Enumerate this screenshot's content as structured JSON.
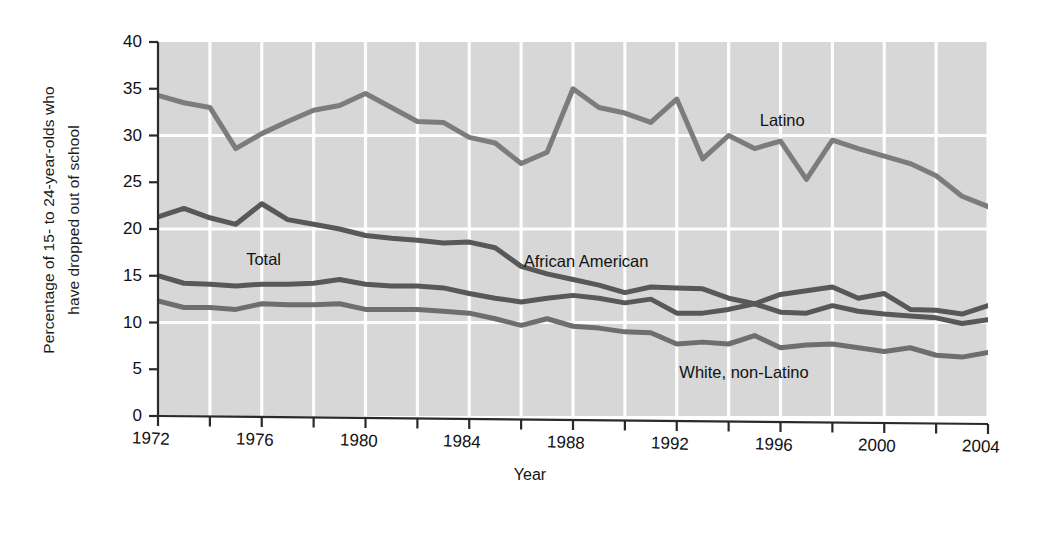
{
  "chart_data": {
    "type": "line",
    "title": "",
    "xlabel": "Year",
    "ylabel": "Percentage of 15- to  24-year-olds who have dropped out of school",
    "ylabel_line1": "Percentage of 15- to  24-year-olds who",
    "ylabel_line2": "have dropped out of school",
    "xlim": [
      1972,
      2004
    ],
    "ylim": [
      0,
      40
    ],
    "grid": "both",
    "legend_position": "inline-annotations",
    "y_ticks": [
      0,
      5,
      10,
      15,
      20,
      25,
      30,
      35,
      40
    ],
    "y_tick_labels": [
      "0",
      "5",
      "10",
      "15",
      "20",
      "25",
      "30",
      "35",
      "40"
    ],
    "x_ticks": [
      1972,
      1974,
      1976,
      1978,
      1980,
      1982,
      1984,
      1986,
      1988,
      1990,
      1992,
      1994,
      1996,
      1998,
      2000,
      2002,
      2004
    ],
    "x_tick_labels_shown": [
      "1972",
      "1976",
      "1980",
      "1984",
      "1988",
      "1992",
      "1996",
      "2000",
      "2004"
    ],
    "x_tick_labels_shown_values": [
      1972,
      1976,
      1980,
      1984,
      1988,
      1992,
      1996,
      2000,
      2004
    ],
    "x": [
      1972,
      1973,
      1974,
      1975,
      1976,
      1977,
      1978,
      1979,
      1980,
      1981,
      1982,
      1983,
      1984,
      1985,
      1986,
      1987,
      1988,
      1989,
      1990,
      1991,
      1992,
      1993,
      1994,
      1995,
      1996,
      1997,
      1998,
      1999,
      2000,
      2001,
      2002,
      2003,
      2004
    ],
    "series": [
      {
        "name": "Latino",
        "color": "#7c7c7c",
        "values": [
          34.3,
          33.5,
          33.0,
          28.6,
          30.2,
          31.5,
          32.7,
          33.2,
          34.5,
          33.0,
          31.5,
          31.4,
          29.8,
          29.2,
          27.0,
          28.2,
          35.0,
          33.0,
          32.4,
          31.4,
          33.9,
          27.5,
          30.0,
          28.6,
          29.4,
          25.3,
          29.5,
          28.6,
          27.8,
          27.0,
          25.7,
          23.5,
          22.4
        ]
      },
      {
        "name": "African American",
        "color": "#585858",
        "values": [
          21.3,
          22.2,
          21.2,
          20.5,
          22.7,
          21.0,
          20.5,
          20.0,
          19.3,
          19.0,
          18.8,
          18.5,
          18.6,
          18.0,
          16.0,
          15.2,
          14.6,
          14.0,
          13.2,
          13.8,
          13.7,
          13.6,
          12.6,
          12.0,
          13.0,
          13.4,
          13.8,
          12.6,
          13.1,
          11.4,
          11.3,
          10.9,
          11.8
        ]
      },
      {
        "name": "Total",
        "color": "#585858",
        "values": [
          15.0,
          14.2,
          14.1,
          13.9,
          14.1,
          14.1,
          14.2,
          14.6,
          14.1,
          13.9,
          13.9,
          13.7,
          13.1,
          12.6,
          12.2,
          12.6,
          12.9,
          12.6,
          12.1,
          12.5,
          11.0,
          11.0,
          11.4,
          12.0,
          11.1,
          11.0,
          11.8,
          11.2,
          10.9,
          10.7,
          10.5,
          9.9,
          10.3
        ]
      },
      {
        "name": "White, non-Latino",
        "color": "#6e6e6e",
        "values": [
          12.3,
          11.6,
          11.6,
          11.4,
          12.0,
          11.9,
          11.9,
          12.0,
          11.4,
          11.4,
          11.4,
          11.2,
          11.0,
          10.4,
          9.7,
          10.4,
          9.6,
          9.4,
          9.0,
          8.9,
          7.7,
          7.9,
          7.7,
          8.6,
          7.3,
          7.6,
          7.7,
          7.3,
          6.9,
          7.3,
          6.5,
          6.3,
          6.8
        ]
      }
    ],
    "annotations": [
      {
        "text": "Latino",
        "x": 1995.2,
        "y": 31.5
      },
      {
        "text": "African American",
        "x": 1986.1,
        "y": 16.5
      },
      {
        "text": "Total",
        "x": 1975.4,
        "y": 16.7
      },
      {
        "text": "White, non-Latino",
        "x": 1992.1,
        "y": 4.6
      }
    ],
    "style": {
      "plot_background": "#d7d7d7",
      "grid_color": "#fdfdfd",
      "axis_color": "#2a2a2a",
      "page_background": "#ffffff"
    }
  }
}
